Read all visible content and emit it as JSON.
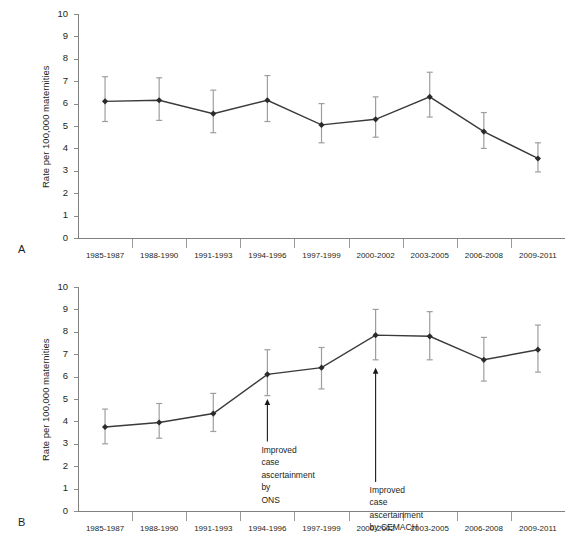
{
  "figure": {
    "panels": [
      {
        "letter": "A",
        "ylabel": "Rate per 100,000 maternities",
        "chart_ref": 0
      },
      {
        "letter": "B",
        "ylabel": "Rate per 100,000 maternities",
        "chart_ref": 1
      }
    ]
  },
  "chart_data": [
    {
      "type": "line",
      "panel": "A",
      "title": "",
      "xlabel": "",
      "ylabel": "Rate per 100,000 maternities",
      "ylim": [
        0,
        10
      ],
      "yticks": [
        0,
        1,
        2,
        3,
        4,
        5,
        6,
        7,
        8,
        9,
        10
      ],
      "grid": false,
      "legend": "none",
      "error_bars": "vertical",
      "categories": [
        "1985-1987",
        "1988-1990",
        "1991-1993",
        "1994-1996",
        "1997-1999",
        "2000-2002",
        "2003-2005",
        "2006-2008",
        "2009-2011"
      ],
      "values": [
        6.1,
        6.15,
        5.55,
        6.15,
        5.05,
        5.3,
        6.3,
        4.75,
        3.55
      ],
      "err_low": [
        5.2,
        5.25,
        4.7,
        5.2,
        4.25,
        4.5,
        5.4,
        4.0,
        2.95
      ],
      "err_high": [
        7.2,
        7.15,
        6.6,
        7.25,
        6.0,
        6.3,
        7.4,
        5.6,
        4.25
      ],
      "annotations": []
    },
    {
      "type": "line",
      "panel": "B",
      "title": "",
      "xlabel": "",
      "ylabel": "Rate per 100,000 maternities",
      "ylim": [
        0,
        10
      ],
      "yticks": [
        0,
        1,
        2,
        3,
        4,
        5,
        6,
        7,
        8,
        9,
        10
      ],
      "grid": false,
      "legend": "none",
      "error_bars": "vertical",
      "categories": [
        "1985-1987",
        "1988-1990",
        "1991-1993",
        "1994-1996",
        "1997-1999",
        "2000-2002",
        "2003-2005",
        "2006-2008",
        "2009-2011"
      ],
      "values": [
        3.75,
        3.95,
        4.35,
        6.1,
        6.4,
        7.85,
        7.8,
        6.75,
        7.2
      ],
      "err_low": [
        3.0,
        3.25,
        3.55,
        5.15,
        5.45,
        6.75,
        6.75,
        5.8,
        6.2
      ],
      "err_high": [
        4.55,
        4.8,
        5.25,
        7.2,
        7.3,
        9.0,
        8.9,
        7.75,
        8.3
      ],
      "annotations": [
        {
          "text": "Improved case\nascertainment by\nONS",
          "at_category": "1994-1996",
          "arrow_from_value": 3.1,
          "arrow_to_value": 5.0
        },
        {
          "text": "Improved case\nascertainment\nby CEMACH",
          "at_category": "2000-2002",
          "arrow_from_value": 1.3,
          "arrow_to_value": 6.4
        }
      ]
    }
  ]
}
